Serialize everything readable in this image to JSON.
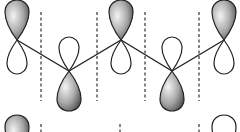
{
  "diagram": {
    "type": "p-orbital chain (molecular orbital nodal diagram)",
    "colors": {
      "background": "#ffffff",
      "outline": "#222222",
      "shade_light": "#f2f2f2",
      "shade_dark": "#5a5a5a",
      "node_line": "#333333"
    },
    "row1": {
      "orbitals": [
        {
          "x": 17,
          "phase": "up"
        },
        {
          "x": 69,
          "phase": "down"
        },
        {
          "x": 121,
          "phase": "up"
        },
        {
          "x": 172,
          "phase": "down"
        },
        {
          "x": 224,
          "phase": "up"
        }
      ],
      "nodal_planes_x": [
        41,
        97,
        145,
        199
      ],
      "bond_path": [
        [
          17,
          40
        ],
        [
          69,
          71
        ],
        [
          121,
          40
        ],
        [
          172,
          71
        ],
        [
          224,
          40
        ]
      ]
    },
    "row2": {
      "orbitals": [
        {
          "x": 17,
          "phase": "up-shaded"
        },
        {
          "x": 224,
          "phase": "up-open"
        }
      ],
      "nodal_planes_x": [
        41,
        120,
        199
      ]
    }
  }
}
